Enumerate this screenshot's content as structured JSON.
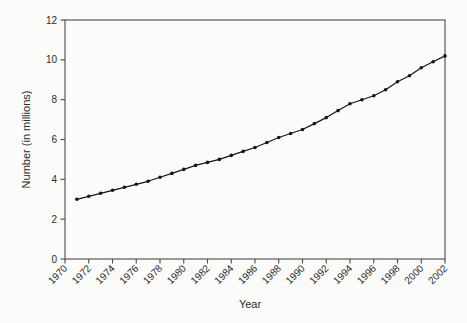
{
  "figure": {
    "background_color": "#fbfbf9",
    "axis_color": "#4a4a4a",
    "line_color": "#161616",
    "marker_color": "#161616",
    "text_color": "#2b2b2b"
  },
  "chart_data": {
    "type": "line",
    "title": "",
    "xlabel": "Year",
    "ylabel": "Number (in millions)",
    "x": [
      1971,
      1972,
      1973,
      1974,
      1975,
      1976,
      1977,
      1978,
      1979,
      1980,
      1981,
      1982,
      1983,
      1984,
      1985,
      1986,
      1987,
      1988,
      1989,
      1990,
      1991,
      1992,
      1993,
      1994,
      1995,
      1996,
      1997,
      1998,
      1999,
      2000,
      2001,
      2002
    ],
    "values": [
      3.0,
      3.15,
      3.3,
      3.45,
      3.6,
      3.75,
      3.9,
      4.1,
      4.3,
      4.5,
      4.7,
      4.85,
      5.0,
      5.2,
      5.4,
      5.6,
      5.85,
      6.1,
      6.3,
      6.5,
      6.8,
      7.1,
      7.45,
      7.8,
      8.0,
      8.2,
      8.5,
      8.9,
      9.2,
      9.6,
      9.9,
      10.2
    ],
    "xlim": [
      1970,
      2002
    ],
    "ylim": [
      0,
      12
    ],
    "xticks": [
      1970,
      1972,
      1974,
      1976,
      1978,
      1980,
      1982,
      1984,
      1986,
      1988,
      1990,
      1992,
      1994,
      1996,
      1998,
      2000,
      2002
    ],
    "yticks": [
      0,
      2,
      4,
      6,
      8,
      10,
      12
    ],
    "xtick_labels": [
      "1970",
      "1972",
      "1974",
      "1976",
      "1978",
      "1980",
      "1982",
      "1984",
      "1986",
      "1988",
      "1990",
      "1992",
      "1994",
      "1996",
      "1998",
      "2000",
      "2002"
    ],
    "ytick_labels": [
      "0",
      "2",
      "4",
      "6",
      "8",
      "10",
      "12"
    ],
    "grid": false,
    "legend": "none",
    "marker": "filled-dot",
    "xtick_rotation_deg": 45
  }
}
